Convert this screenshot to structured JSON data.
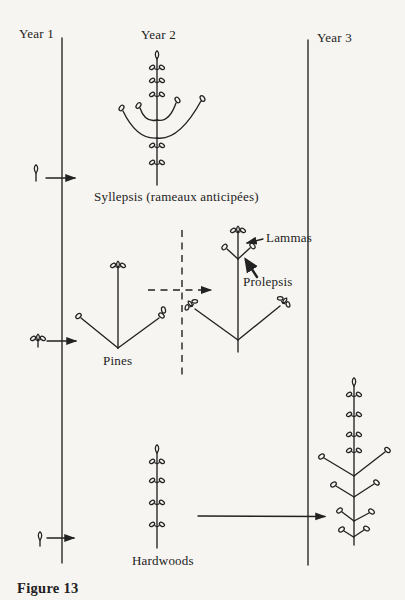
{
  "figure": {
    "caption": "Figure 13",
    "columns": {
      "year1": "Year 1",
      "year2": "Year 2",
      "year3": "Year 3"
    },
    "labels": {
      "syllepsis": "Syllepsis (rameaux anticipées)",
      "pines": "Pines",
      "lammas": "Lammas",
      "prolepsis": "Prolepsis",
      "hardwoods": "Hardwoods"
    },
    "colors": {
      "ink": "#222222",
      "paper": "#f7f5f1"
    },
    "icons": {
      "terminal_bud": "teardrop-bud-icon",
      "paired_buds": "paired-buds-icon",
      "bud_cluster": "bud-cluster-icon",
      "arrow": "right-arrow-icon"
    }
  }
}
